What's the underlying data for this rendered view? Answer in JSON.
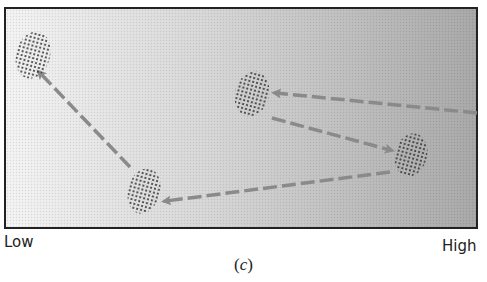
{
  "diagram": {
    "gradient": {
      "start_color": "#f4f4f4",
      "end_color": "#a9a9a9"
    },
    "border_color": "#222222",
    "arrow_color": "#8a8a8a",
    "blob_dot_color": "#2a2a2a",
    "blobs": [
      {
        "id": "blob-top-left",
        "cx": 33,
        "cy": 55,
        "rx": 17,
        "ry": 24
      },
      {
        "id": "blob-bottom-center",
        "cx": 144,
        "cy": 191,
        "rx": 16,
        "ry": 23
      },
      {
        "id": "blob-middle-upper",
        "cx": 252,
        "cy": 94,
        "rx": 17,
        "ry": 23
      },
      {
        "id": "blob-right",
        "cx": 411,
        "cy": 155,
        "rx": 16,
        "ry": 22
      }
    ],
    "arrows": [
      {
        "id": "arrow-from-right-edge-to-middle-upper",
        "x1": 477,
        "y1": 113,
        "x2": 276,
        "y2": 93
      },
      {
        "id": "arrow-middle-upper-to-right",
        "x1": 272,
        "y1": 118,
        "x2": 390,
        "y2": 150
      },
      {
        "id": "arrow-right-to-bottom-center",
        "x1": 390,
        "y1": 172,
        "x2": 166,
        "y2": 201
      },
      {
        "id": "arrow-bottom-center-to-top-left",
        "x1": 130,
        "y1": 167,
        "x2": 40,
        "y2": 73
      }
    ]
  },
  "axis": {
    "low_label": "Low",
    "high_label": "High"
  },
  "caption": {
    "open": "(",
    "letter": "c",
    "close": ")"
  }
}
